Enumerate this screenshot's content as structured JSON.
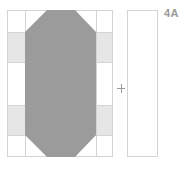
{
  "diagram": {
    "label": "4A",
    "operator": "+",
    "colors": {
      "background": "#ffffff",
      "outline": "#d4d4d4",
      "band_fill": "#e6e6e6",
      "octagon_fill": "#9b9b9b",
      "label": "#9a9a9a",
      "plus": "#9a9a9a"
    },
    "block": {
      "outer": {
        "x": 7,
        "y": 10,
        "w": 106,
        "h": 147
      },
      "vertical_lines_x": [
        25,
        96
      ],
      "bands": [
        {
          "y": 32,
          "h": 30
        },
        {
          "y": 105,
          "h": 30
        }
      ],
      "octagon_points": "47,10 75,10 96,32 96,135 75,157 47,157 25,135 25,32"
    },
    "strip": {
      "x": 127,
      "y": 10,
      "w": 31,
      "h": 147
    }
  }
}
